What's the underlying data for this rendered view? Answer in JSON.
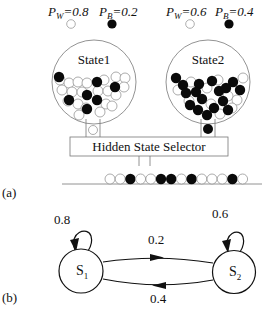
{
  "figure": {
    "panel_a": {
      "label": "(a)",
      "states": [
        {
          "name": "State1",
          "legend": [
            {
              "symbol": "P",
              "subscript": "W",
              "value": "=0.8",
              "ball_color": "white"
            },
            {
              "symbol": "P",
              "subscript": "B",
              "value": "=0.2",
              "ball_color": "black"
            }
          ],
          "dispensed_ball": "white"
        },
        {
          "name": "State2",
          "legend": [
            {
              "symbol": "P",
              "subscript": "W",
              "value": "=0.6",
              "ball_color": "white"
            },
            {
              "symbol": "P",
              "subscript": "B",
              "value": "=0.4",
              "ball_color": "black"
            }
          ],
          "dispensed_ball": "black"
        }
      ],
      "selector_label": "Hidden State Selector",
      "output_sequence": [
        "W",
        "W",
        "B",
        "W",
        "W",
        "B",
        "B",
        "W",
        "B",
        "W",
        "W",
        "W",
        "B",
        "W"
      ]
    },
    "panel_b": {
      "label": "(b)",
      "nodes": [
        {
          "id": "S1",
          "label": "S",
          "subscript": "1"
        },
        {
          "id": "S2",
          "label": "S",
          "subscript": "2"
        }
      ],
      "transitions": [
        {
          "from": "S1",
          "to": "S1",
          "prob": "0.8"
        },
        {
          "from": "S1",
          "to": "S2",
          "prob": "0.2"
        },
        {
          "from": "S2",
          "to": "S1",
          "prob": "0.4"
        },
        {
          "from": "S2",
          "to": "S2",
          "prob": "0.6"
        }
      ]
    }
  },
  "colors": {
    "ink": "#111111",
    "ball_black": "#0a0a0a",
    "ball_white": "#ffffff",
    "outline": "#555555"
  }
}
